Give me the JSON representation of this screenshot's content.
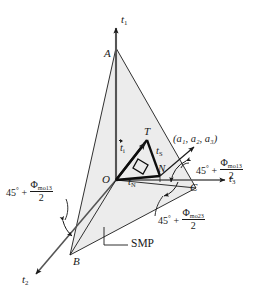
{
  "figure": {
    "type": "geometry-diagram",
    "fill_color": "#ececec",
    "stroke_color": "#1a1a1a"
  },
  "axes": {
    "t1": {
      "label": "t",
      "sub": "1"
    },
    "t2": {
      "label": "t",
      "sub": "2"
    },
    "t3": {
      "label": "t",
      "sub": "3"
    }
  },
  "points": {
    "A": "A",
    "B": "B",
    "C": "C",
    "O": "O",
    "N": "N",
    "T": "T"
  },
  "vectors": {
    "ti": {
      "label": "t",
      "sub": "i"
    },
    "tS": {
      "label": "t",
      "sub": "S"
    },
    "tN": {
      "label": "t",
      "sub": "N"
    }
  },
  "annotations": {
    "coords": "(a₁, a₂, a₃)",
    "smp": "SMP",
    "angle_left": {
      "base": "45",
      "deg": "°",
      "plus": "+",
      "phi": "Φ",
      "phi_sub": "mo13",
      "den": "2"
    },
    "angle_right": {
      "base": "45",
      "deg": "°",
      "plus": "+",
      "phi": "Φ",
      "phi_sub": "mo13",
      "den": "2"
    },
    "angle_bottom": {
      "base": "45",
      "deg": "°",
      "plus": "+",
      "phi": "Φ",
      "phi_sub": "mo23",
      "den": "2"
    }
  }
}
